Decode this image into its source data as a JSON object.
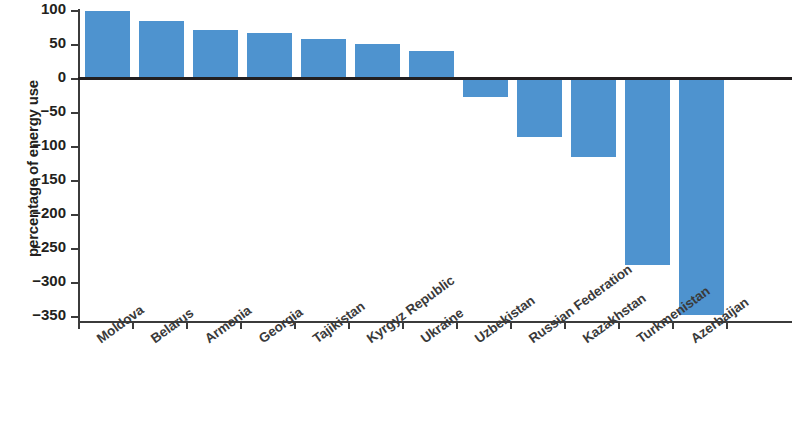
{
  "chart_data": {
    "type": "bar",
    "title": "",
    "subtitle": "",
    "xlabel": "",
    "ylabel": "percentage of energy use",
    "ylim": [
      -350,
      100
    ],
    "ytick_values": [
      100,
      50,
      0,
      -50,
      -100,
      -150,
      -200,
      -250,
      -300,
      -350
    ],
    "ytick_labels": [
      "100",
      "50",
      "0",
      "−50",
      "−100",
      "−150",
      "−200",
      "−250",
      "−300",
      "−350"
    ],
    "grid": false,
    "legend": null,
    "bar_color": "#4e93cf",
    "axis_color": "#231f20",
    "categories": [
      "Moldova",
      "Belarus",
      "Armenia",
      "Georgia",
      "Tajikistan",
      "Kyrgyz Republic",
      "Ukraine",
      "Uzbekistan",
      "Russian Federation",
      "Kazakhstan",
      "Turkmenistan",
      "Azerbaijan"
    ],
    "values": [
      98,
      84,
      70,
      66,
      57,
      50,
      39,
      -28,
      -87,
      -116,
      -275,
      -348
    ]
  }
}
